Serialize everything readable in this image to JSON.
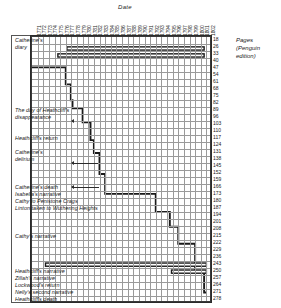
{
  "chart_data": {
    "type": "line",
    "title": "",
    "xlabel": "Date",
    "ylabel": "Pages (Penguin edition)",
    "grid": true,
    "legend": null,
    "xlim": [
      1771,
      1802
    ],
    "ylim": [
      18,
      278
    ],
    "x_tick_labels": [
      "1771",
      "1772",
      "1773",
      "1774",
      "1775",
      "1776",
      "1777",
      "1778",
      "1779",
      "1780",
      "1781",
      "1782",
      "1783",
      "1784",
      "1785",
      "1786",
      "1787",
      "1788",
      "1789",
      "1790",
      "1791",
      "1792",
      "1793",
      "1794",
      "1795",
      "1796",
      "1797",
      "1798",
      "1799",
      "1800",
      "1801",
      "1802"
    ],
    "y_tick_labels": [
      "18",
      "26",
      "33",
      "40",
      "47",
      "54",
      "61",
      "68",
      "75",
      "82",
      "89",
      "96",
      "103",
      "110",
      "117",
      "124",
      "131",
      "138",
      "145",
      "152",
      "159",
      "166",
      "173",
      "180",
      "187",
      "194",
      "201",
      "208",
      "215",
      "222",
      "229",
      "236",
      "243",
      "250",
      "257",
      "264",
      "271",
      "278"
    ],
    "series": [
      {
        "name": "Narrative chronology (step)",
        "step": true,
        "points": [
          [
            1771.0,
            45
          ],
          [
            1777.0,
            45
          ],
          [
            1777.0,
            62
          ],
          [
            1777.9,
            62
          ],
          [
            1777.9,
            78
          ],
          [
            1778.2,
            78
          ],
          [
            1778.2,
            86
          ],
          [
            1780.0,
            86
          ],
          [
            1780.0,
            100
          ],
          [
            1781.4,
            100
          ],
          [
            1781.4,
            118
          ],
          [
            1782.0,
            118
          ],
          [
            1782.0,
            131
          ],
          [
            1783.0,
            131
          ],
          [
            1783.0,
            152
          ],
          [
            1784.0,
            152
          ],
          [
            1784.0,
            172
          ],
          [
            1793.0,
            172
          ],
          [
            1793.0,
            190
          ],
          [
            1795.5,
            190
          ],
          [
            1795.5,
            205
          ],
          [
            1797.0,
            205
          ],
          [
            1797.0,
            222
          ],
          [
            1800.0,
            222
          ],
          [
            1800.0,
            250
          ],
          [
            1801.6,
            250
          ],
          [
            1801.6,
            271
          ],
          [
            1802.0,
            271
          ]
        ]
      },
      {
        "name": "Catherine's diary (bar)",
        "type": "span",
        "x_start": 1777.2,
        "x_end": 1801.6,
        "y": 26
      },
      {
        "name": "Catherine's diary (bar 2)",
        "type": "span",
        "x_start": 1775.6,
        "x_end": 1801.6,
        "y": 33
      },
      {
        "name": "Lockwood's narrative (bar)",
        "type": "span",
        "x_start": 1773.4,
        "x_end": 1802.0,
        "y": 243
      },
      {
        "name": "Heathcliff's narrative (bar)",
        "type": "span",
        "x_start": 1795.8,
        "x_end": 1802.0,
        "y": 250
      }
    ],
    "annotations": [
      {
        "label": "Catherine's diary",
        "lines": [
          "Catherine's",
          "diary"
        ],
        "y_page": 26
      },
      {
        "label": "The day of Heathcliff's disappearance",
        "lines": [
          "The day of Heathcliff's",
          "disappearance"
        ],
        "y_page": 96
      },
      {
        "label": "Heathcliff's return",
        "lines": [
          "Heathcliff's return"
        ],
        "y_page": 117
      },
      {
        "label": "Catherine's delirium",
        "lines": [
          "Catherine's",
          "delirium"
        ],
        "y_page": 138
      },
      {
        "label": "Catherine's death",
        "lines": [
          "Catherine's death"
        ],
        "y_page": 166
      },
      {
        "label": "Isabella's narrative",
        "lines": [
          "Isabella's narrative"
        ],
        "y_page": 173
      },
      {
        "label": "Cathy to Penistone Crags",
        "lines": [
          "Cathy to Penistone Crags"
        ],
        "y_page": 180
      },
      {
        "label": "Linton taken to Wuthering Heights",
        "lines": [
          "Linton taken to Wuthering Heights"
        ],
        "y_page": 187
      },
      {
        "label": "Cathy's narrative",
        "lines": [
          "Cathy's narrative"
        ],
        "y_page": 215
      },
      {
        "label": "Heathcliff's narrative",
        "lines": [
          "Heathcliff's narrative"
        ],
        "y_page": 250
      },
      {
        "label": "Zillah's narrative",
        "lines": [
          "Zillah's narrative"
        ],
        "y_page": 257
      },
      {
        "label": "Lockwood's return",
        "lines": [
          "Lockwood's return"
        ],
        "y_page": 264
      },
      {
        "label": "Nelly's second narrative",
        "lines": [
          "Nelly's second narrative"
        ],
        "y_page": 271
      },
      {
        "label": "Heathcliff's death",
        "lines": [
          "Heathcliff's death"
        ],
        "y_page": 278
      }
    ]
  },
  "axes": {
    "x_title": "Date",
    "y_caption_lines": [
      "Pages",
      "(Penguin",
      "edition)"
    ]
  },
  "events": {
    "catherines_diary_l1": "Catherine's",
    "catherines_diary_l2": "diary",
    "disappearance_l1": "The day of Heathcliff's",
    "disappearance_l2": "disappearance",
    "heathcliff_return": "Heathcliff's return",
    "delirium_l1": "Catherine's",
    "delirium_l2": "delirium",
    "catherine_death": "Catherine's death",
    "isabella_narrative": "Isabella's narrative",
    "cathy_penistone": "Cathy to Penistone Crags",
    "linton_taken": "Linton taken to Wuthering Heights",
    "cathys_narrative": "Cathy's narrative",
    "heathcliff_narrative": "Heathcliff's narrative",
    "zillah_narrative": "Zillah's narrative",
    "lockwood_return": "Lockwood's return",
    "nelly_second": "Nelly's second narrative",
    "heathcliff_death": "Heathcliff's death"
  },
  "colors": {
    "ink": "#1a1a1a",
    "grid": "#9a9a9a",
    "frame": "#2b2b2b",
    "paper": "#ffffff"
  }
}
